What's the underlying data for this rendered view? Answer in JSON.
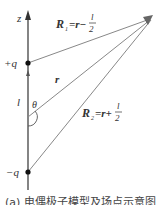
{
  "diagram": {
    "axis_label": "z",
    "charge_pos": "+q",
    "charge_neg": "−q",
    "separation": "l",
    "angle": "θ",
    "r_label": "r",
    "R1": {
      "name": "R",
      "sub": "1",
      "eq": "=r−",
      "frac_num": "l",
      "frac_den": "2"
    },
    "R2": {
      "name": "R",
      "sub": "2",
      "eq": "=r+",
      "frac_num": "l",
      "frac_den": "2"
    },
    "colors": {
      "axis": "#333333",
      "vectors": "#777777",
      "charge": "#111111"
    }
  },
  "caption": "(a) 电偶极子模型及场点示意图"
}
